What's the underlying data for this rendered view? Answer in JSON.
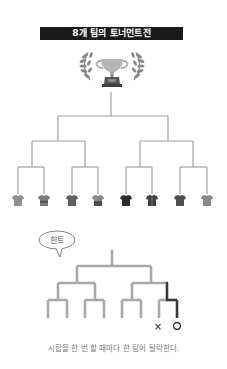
{
  "title": "8개 팀의 토너먼트전",
  "icons": {
    "trophy": "trophy-icon",
    "laurel": "laurel-wreath-icon",
    "shirt": "team-shirt-icon",
    "speech_bubble": "speech-bubble-icon"
  },
  "bracket": {
    "team_count": 8,
    "line_color": "#a0a0a0",
    "teams": [
      {
        "id": 1,
        "shirt_color": "#8f8f8f"
      },
      {
        "id": 2,
        "shirt_color": "#7a7a7a"
      },
      {
        "id": 3,
        "shirt_color": "#5e5e5e"
      },
      {
        "id": 4,
        "shirt_color": "#6a6a6a"
      },
      {
        "id": 5,
        "shirt_color": "#2c2c2c"
      },
      {
        "id": 6,
        "shirt_color": "#3e3e3e"
      },
      {
        "id": 7,
        "shirt_color": "#4f4f4f"
      },
      {
        "id": 8,
        "shirt_color": "#888888"
      }
    ]
  },
  "hint": {
    "bubble_label": "힌트",
    "line_color": "#a8a8a8",
    "winner_path_color": "#3a3a3a",
    "loser_mark": "×",
    "winner_mark": "○"
  },
  "caption": "시합을 한 번 할 때마다 한 팀이 탈락한다."
}
